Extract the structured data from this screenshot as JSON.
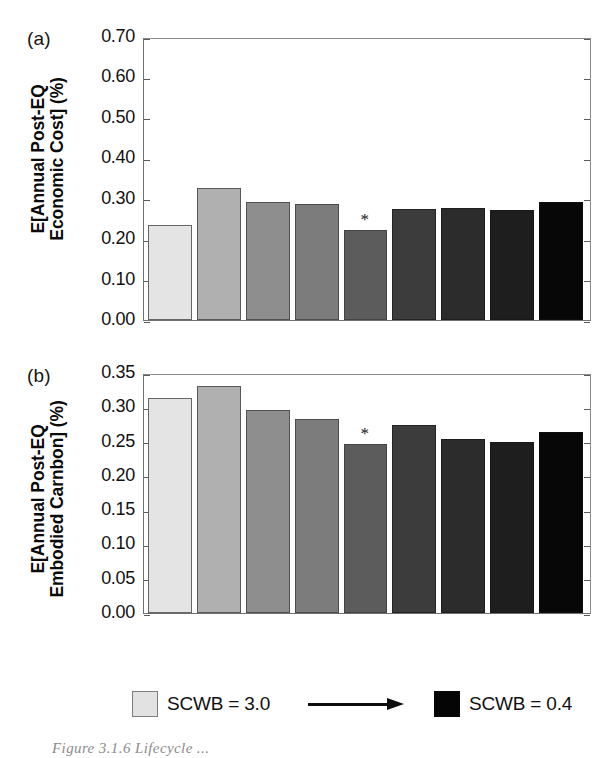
{
  "figure": {
    "caption": "Figure 3.1.6  Lifecycle ...",
    "panel_a_tag": "(a)",
    "panel_b_tag": "(b)"
  },
  "legend": {
    "left_swatch_color": "#e2e2e2",
    "left_label": "SCWB = 3.0",
    "arrow_name": "rightwards-arrow",
    "right_swatch_color": "#050505",
    "right_label": "SCWB = 0.4"
  },
  "significance_marker": "*",
  "chart_data": [
    {
      "type": "bar",
      "panel": "(a)",
      "title": "",
      "xlabel": "",
      "ylabel": "E[Annual Post-EQ Economic Cost] (%)",
      "ylabel_lines": [
        "E[Annual Post-EQ",
        "Economic Cost] (%)"
      ],
      "ylim": [
        0.0,
        0.7
      ],
      "ytick_labels": [
        "0.70",
        "0.60",
        "0.50",
        "0.40",
        "0.30",
        "0.20",
        "0.10",
        "0.00"
      ],
      "yticks": [
        0.7,
        0.6,
        0.5,
        0.4,
        0.3,
        0.2,
        0.1,
        0.0
      ],
      "grid": false,
      "legend_position": "below-figure",
      "categories": [
        "3.0",
        "2.7",
        "2.4",
        "2.1",
        "1.8",
        "1.5",
        "1.2",
        "0.8",
        "0.4"
      ],
      "values": [
        0.236,
        0.327,
        0.293,
        0.288,
        0.222,
        0.274,
        0.277,
        0.272,
        0.292
      ],
      "colors": [
        "#e4e4e4",
        "#b0b0b0",
        "#8e8e8e",
        "#7c7c7c",
        "#5c5c5c",
        "#3c3c3c",
        "#2c2c2c",
        "#1e1e1e",
        "#070707"
      ],
      "annotations": [
        {
          "index": 4,
          "text": "*"
        }
      ]
    },
    {
      "type": "bar",
      "panel": "(b)",
      "title": "",
      "xlabel": "",
      "ylabel": "E[Annual Post-EQ Embodied Carnbon] (%)",
      "ylabel_lines": [
        "E[Annual Post-EQ",
        "Embodied Carnbon] (%)"
      ],
      "ylim": [
        0.0,
        0.35
      ],
      "ytick_labels": [
        "0.35",
        "0.30",
        "0.25",
        "0.20",
        "0.15",
        "0.10",
        "0.05",
        "0.00"
      ],
      "yticks": [
        0.35,
        0.3,
        0.25,
        0.2,
        0.15,
        0.1,
        0.05,
        0.0
      ],
      "grid": false,
      "legend_position": "below-figure",
      "categories": [
        "3.0",
        "2.7",
        "2.4",
        "2.1",
        "1.8",
        "1.5",
        "1.2",
        "0.8",
        "0.4"
      ],
      "values": [
        0.313,
        0.331,
        0.296,
        0.283,
        0.246,
        0.274,
        0.254,
        0.249,
        0.264
      ],
      "colors": [
        "#e4e4e4",
        "#b0b0b0",
        "#8e8e8e",
        "#7c7c7c",
        "#5c5c5c",
        "#3c3c3c",
        "#2c2c2c",
        "#1e1e1e",
        "#070707"
      ],
      "annotations": [
        {
          "index": 4,
          "text": "*"
        }
      ]
    }
  ]
}
